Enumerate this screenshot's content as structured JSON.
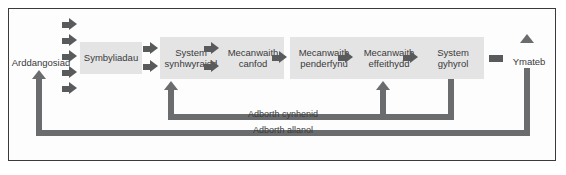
{
  "figure": {
    "language": "cy"
  },
  "colors": {
    "box_fill": "#e4e4e4",
    "text": "#3a3a3c",
    "arrow": "#595a5c",
    "feedback_line": "#6b6c6e",
    "frame_border": "#3b3b3d",
    "background": "#ffffff"
  },
  "endpoints": {
    "input_label": "Arddangosiad",
    "output_label": "Ymateb"
  },
  "stages": [
    {
      "label": "Symbyliadau"
    },
    {
      "label": "System synhwyraidd"
    },
    {
      "label": "Mecanwaith canfod"
    },
    {
      "label": "Mecanwaith penderfynu"
    },
    {
      "label": "Mecanwaith effeithydd"
    },
    {
      "label": "System gyhyrol"
    }
  ],
  "feedback": [
    {
      "label": "Adborth cynhenid"
    },
    {
      "label": "Adborth allanol"
    }
  ]
}
